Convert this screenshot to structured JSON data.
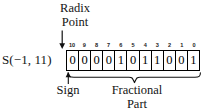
{
  "figure": {
    "format_label": "S(−1, 11)",
    "radix_point_caption": {
      "line1": "Radix",
      "line2": "Point"
    },
    "sign_caption": "Sign",
    "fractional_caption": {
      "line1": "Fractional",
      "line2": "Part"
    },
    "bit_indices": [
      "10",
      "9",
      "8",
      "7",
      "6",
      "5",
      "4",
      "3",
      "2",
      "1",
      "0"
    ],
    "bits": [
      "0",
      "0",
      "0",
      "0",
      "1",
      "0",
      "1",
      "1",
      "0",
      "0",
      "1"
    ],
    "colors": {
      "background": "#ffffff",
      "ink": "#141414",
      "box_border": "#000000"
    },
    "icons": {
      "radix_arrow": "arrow-down-icon",
      "sign_arrow": "arrow-up-icon",
      "fractional_brace": "curly-brace-icon"
    }
  }
}
